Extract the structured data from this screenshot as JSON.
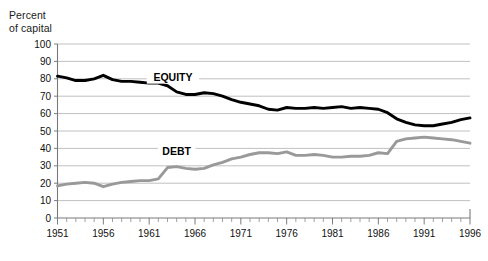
{
  "axis_title": "Percent\nof capital",
  "chart_data": {
    "type": "line",
    "title": "",
    "subtitle": "",
    "xlabel": "",
    "ylabel": "Percent of capital",
    "ylim": [
      0,
      100
    ],
    "xlim": [
      1951,
      1996
    ],
    "grid": true,
    "legend_position": "inline-labels",
    "ytick_labels": [
      "0",
      "10",
      "20",
      "30",
      "40",
      "50",
      "60",
      "70",
      "80",
      "90",
      "100"
    ],
    "ytick_values": [
      0,
      10,
      20,
      30,
      40,
      50,
      60,
      70,
      80,
      90,
      100
    ],
    "xtick_labels": [
      "1951",
      "1956",
      "1961",
      "1966",
      "1971",
      "1976",
      "1981",
      "1986",
      "1991",
      "1996"
    ],
    "xtick_values": [
      1951,
      1956,
      1961,
      1966,
      1971,
      1976,
      1981,
      1986,
      1991,
      1996
    ],
    "x": [
      1951,
      1952,
      1953,
      1954,
      1955,
      1956,
      1957,
      1958,
      1959,
      1960,
      1961,
      1962,
      1963,
      1964,
      1965,
      1966,
      1967,
      1968,
      1969,
      1970,
      1971,
      1972,
      1973,
      1974,
      1975,
      1976,
      1977,
      1978,
      1979,
      1980,
      1981,
      1982,
      1983,
      1984,
      1985,
      1986,
      1987,
      1988,
      1989,
      1990,
      1991,
      1992,
      1993,
      1994,
      1995,
      1996
    ],
    "series": [
      {
        "name": "EQUITY",
        "color": "#000000",
        "label_x": 1963.6,
        "label_y": 79.5,
        "values": [
          81.5,
          80.5,
          79.0,
          79.0,
          80.0,
          82.0,
          79.5,
          78.5,
          78.5,
          78.0,
          77.5,
          77.5,
          76.0,
          72.5,
          71.0,
          71.0,
          72.0,
          71.5,
          70.0,
          68.0,
          66.5,
          65.5,
          64.5,
          62.5,
          62.0,
          63.5,
          63.0,
          63.0,
          63.5,
          63.0,
          63.5,
          64.0,
          63.0,
          63.5,
          63.0,
          62.5,
          60.5,
          57.0,
          55.0,
          53.5,
          53.0,
          53.0,
          54.0,
          55.0,
          56.5,
          57.5
        ]
      },
      {
        "name": "DEBT",
        "color": "#999999",
        "label_x": 1964.0,
        "label_y": 37.0,
        "values": [
          18.5,
          19.5,
          20.0,
          20.5,
          20.0,
          18.0,
          19.5,
          20.5,
          21.0,
          21.5,
          21.5,
          22.5,
          29.0,
          29.5,
          28.5,
          28.0,
          28.5,
          30.5,
          32.0,
          34.0,
          35.0,
          36.5,
          37.5,
          37.5,
          37.0,
          38.0,
          36.0,
          36.0,
          36.5,
          36.0,
          35.0,
          35.0,
          35.5,
          35.5,
          36.0,
          37.5,
          37.0,
          44.0,
          45.5,
          46.0,
          46.5,
          46.0,
          45.5,
          45.0,
          44.0,
          43.0
        ]
      }
    ]
  }
}
